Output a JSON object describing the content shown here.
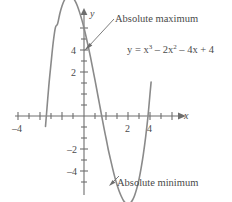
{
  "chart_data": {
    "type": "line",
    "title": "",
    "subtitle": "",
    "xlabel": "x",
    "ylabel": "y",
    "xlim": [
      -4.6,
      5.6
    ],
    "ylim": [
      -5.0,
      6.2
    ],
    "grid": false,
    "legend_position": "none",
    "equation_text": "y = x",
    "equation_parts": {
      "lhs": "y = x",
      "exp1": "3",
      "mid": " – 2x",
      "exp2": "2",
      "tail": " – 4x + 4"
    },
    "function": "y = x^3 - 2x^2 - 4x + 4",
    "x_ticks_major": [
      -4,
      2,
      4
    ],
    "x_tick_labels": [
      "–4",
      "2",
      "4"
    ],
    "x_ticks_minor_step": 0.5,
    "y_ticks_major": [
      4,
      2,
      -2,
      -4
    ],
    "y_tick_labels": [
      "4",
      "2",
      "–2",
      "–4"
    ],
    "y_ticks_minor_step": 0.5,
    "annotations": [
      {
        "label": "Absolute maximum",
        "point_x": 0.0,
        "point_y": 4.0,
        "kind": "absolute-maximum"
      },
      {
        "label": "Absolute minimum",
        "point_x": 1.9,
        "point_y": -4.1,
        "kind": "absolute-minimum"
      }
    ],
    "series": [
      {
        "name": "y = x^3 - 2x^2 - 4x + 4",
        "color": "#8a8a8a",
        "x": [
          -1.75,
          -1.7,
          -1.6,
          -1.5,
          -1.4,
          -1.3,
          -1.2,
          -1.1,
          -1.0,
          -0.9,
          -0.8,
          -0.7,
          -0.6,
          -0.5,
          -0.4,
          -0.3,
          -0.2,
          -0.1,
          0.0,
          0.1,
          0.2,
          0.3,
          0.4,
          0.5,
          0.6,
          0.7,
          0.8,
          0.9,
          1.0,
          1.1,
          1.2,
          1.3,
          1.4,
          1.5,
          1.6,
          1.7,
          1.8,
          1.9,
          2.0,
          2.1,
          2.2,
          2.3,
          2.4,
          2.5,
          2.6,
          2.7,
          2.8,
          2.9,
          3.0,
          3.05
        ],
        "y": [
          -0.48,
          0.15,
          1.36,
          2.38,
          3.34,
          4.02,
          4.19,
          4.65,
          5.0,
          5.25,
          5.41,
          5.48,
          5.46,
          5.38,
          5.22,
          5.0,
          4.71,
          4.38,
          4.0,
          3.58,
          3.13,
          2.65,
          2.14,
          1.63,
          1.1,
          0.56,
          0.03,
          -0.51,
          -1.0,
          -1.51,
          -1.95,
          -2.38,
          -2.78,
          -3.13,
          -3.42,
          -3.66,
          -3.85,
          -3.96,
          -4.0,
          -3.96,
          -3.83,
          -3.61,
          -3.29,
          -2.88,
          -2.35,
          -1.72,
          -0.97,
          -0.1,
          1.0,
          1.54
        ]
      }
    ]
  },
  "axis": {
    "x_arrow_label": "x",
    "y_arrow_label": "y"
  }
}
